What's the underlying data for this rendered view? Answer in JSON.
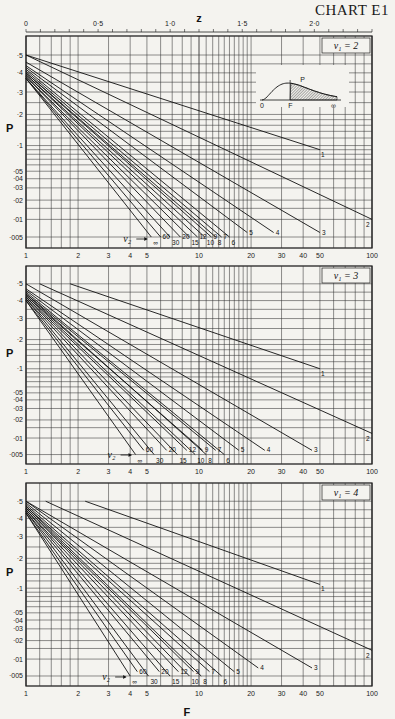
{
  "title": "CHART E1",
  "z_axis": {
    "label": "z",
    "ticks": [
      {
        "v": 0,
        "label": "0"
      },
      {
        "v": 0.5,
        "label": "0·5"
      },
      {
        "v": 1.0,
        "label": "1·0"
      },
      {
        "v": 1.5,
        "label": "1·5"
      },
      {
        "v": 2.0,
        "label": "2·0"
      }
    ]
  },
  "f_axis": {
    "label": "F",
    "ticks": [
      {
        "v": 1,
        "label": "1"
      },
      {
        "v": 2,
        "label": "2"
      },
      {
        "v": 3,
        "label": "3"
      },
      {
        "v": 4,
        "label": "4"
      },
      {
        "v": 5,
        "label": "5"
      },
      {
        "v": 10,
        "label": "10"
      },
      {
        "v": 20,
        "label": "20"
      },
      {
        "v": 30,
        "label": "30"
      },
      {
        "v": 40,
        "label": "40"
      },
      {
        "v": 50,
        "label": "50"
      },
      {
        "v": 100,
        "label": "100"
      }
    ]
  },
  "p_axis": {
    "label": "P",
    "ticks": [
      {
        "v": 0.5,
        "label": "·5"
      },
      {
        "v": 0.4,
        "label": "·4"
      },
      {
        "v": 0.3,
        "label": "·3"
      },
      {
        "v": 0.2,
        "label": "·2"
      },
      {
        "v": 0.1,
        "label": "·1"
      },
      {
        "v": 0.05,
        "label": "·05"
      },
      {
        "v": 0.04,
        "label": "·04"
      },
      {
        "v": 0.03,
        "label": "·03"
      },
      {
        "v": 0.02,
        "label": "·02"
      },
      {
        "v": 0.01,
        "label": "·01"
      },
      {
        "v": 0.005,
        "label": "·005"
      }
    ]
  },
  "inset": {
    "zero": "0",
    "f": "F",
    "inf": "∞",
    "p": "P"
  },
  "nu2_label": "ν₂",
  "chart_data": [
    {
      "type": "line",
      "title": "ν1 = 2",
      "panel_label": "ν₁ = 2",
      "xlabel": "F",
      "ylabel": "P",
      "xscale": "log",
      "xlim": [
        1,
        100
      ],
      "ylim": [
        0.005,
        0.5
      ],
      "series": [
        {
          "name": "1",
          "points": [
            [
              1,
              0.5
            ],
            [
              50,
              0.09
            ]
          ]
        },
        {
          "name": "2",
          "points": [
            [
              1,
              0.5
            ],
            [
              100,
              0.01
            ]
          ]
        },
        {
          "name": "3",
          "points": [
            [
              1,
              0.46
            ],
            [
              50,
              0.006
            ]
          ]
        },
        {
          "name": "4",
          "points": [
            [
              1,
              0.44
            ],
            [
              27,
              0.006
            ]
          ]
        },
        {
          "name": "5",
          "points": [
            [
              1,
              0.43
            ],
            [
              19,
              0.006
            ]
          ]
        },
        {
          "name": "6",
          "points": [
            [
              1,
              0.42
            ],
            [
              15,
              0.005
            ]
          ]
        },
        {
          "name": "7",
          "points": [
            [
              1,
              0.41
            ],
            [
              13.5,
              0.005
            ]
          ]
        },
        {
          "name": "8",
          "points": [
            [
              1,
              0.4
            ],
            [
              12.5,
              0.005
            ]
          ]
        },
        {
          "name": "9",
          "points": [
            [
              1,
              0.4
            ],
            [
              11.8,
              0.005
            ]
          ]
        },
        {
          "name": "10",
          "points": [
            [
              1,
              0.39
            ],
            [
              10.8,
              0.005
            ]
          ]
        },
        {
          "name": "12",
          "points": [
            [
              1,
              0.39
            ],
            [
              9.8,
              0.005
            ]
          ]
        },
        {
          "name": "15",
          "points": [
            [
              1,
              0.38
            ],
            [
              8.8,
              0.005
            ]
          ]
        },
        {
          "name": "20",
          "points": [
            [
              1,
              0.38
            ],
            [
              7.8,
              0.005
            ]
          ]
        },
        {
          "name": "30",
          "points": [
            [
              1,
              0.37
            ],
            [
              6.8,
              0.005
            ]
          ]
        },
        {
          "name": "60",
          "points": [
            [
              1,
              0.37
            ],
            [
              6.0,
              0.005
            ]
          ]
        },
        {
          "name": "∞",
          "points": [
            [
              1,
              0.37
            ],
            [
              5.3,
              0.005
            ]
          ]
        }
      ]
    },
    {
      "type": "line",
      "title": "ν1 = 3",
      "panel_label": "ν₁ = 3",
      "xlabel": "F",
      "ylabel": "P",
      "xscale": "log",
      "xlim": [
        1,
        100
      ],
      "ylim": [
        0.005,
        0.5
      ],
      "series": [
        {
          "name": "1",
          "points": [
            [
              1.8,
              0.5
            ],
            [
              50,
              0.1
            ]
          ]
        },
        {
          "name": "2",
          "points": [
            [
              1.2,
              0.5
            ],
            [
              100,
              0.012
            ]
          ]
        },
        {
          "name": "3",
          "points": [
            [
              1,
              0.5
            ],
            [
              45,
              0.006
            ]
          ]
        },
        {
          "name": "4",
          "points": [
            [
              1,
              0.47
            ],
            [
              24,
              0.006
            ]
          ]
        },
        {
          "name": "5",
          "points": [
            [
              1,
              0.46
            ],
            [
              17,
              0.006
            ]
          ]
        },
        {
          "name": "6",
          "points": [
            [
              1,
              0.45
            ],
            [
              14,
              0.005
            ]
          ]
        },
        {
          "name": "7",
          "points": [
            [
              1,
              0.44
            ],
            [
              12.5,
              0.006
            ]
          ]
        },
        {
          "name": "8",
          "points": [
            [
              1,
              0.44
            ],
            [
              11,
              0.005
            ]
          ]
        },
        {
          "name": "9",
          "points": [
            [
              1,
              0.43
            ],
            [
              10.5,
              0.006
            ]
          ]
        },
        {
          "name": "10",
          "points": [
            [
              1,
              0.43
            ],
            [
              9.5,
              0.005
            ]
          ]
        },
        {
          "name": "12",
          "points": [
            [
              1,
              0.42
            ],
            [
              8.5,
              0.006
            ]
          ]
        },
        {
          "name": "15",
          "points": [
            [
              1,
              0.42
            ],
            [
              7.5,
              0.005
            ]
          ]
        },
        {
          "name": "20",
          "points": [
            [
              1,
              0.41
            ],
            [
              6.5,
              0.006
            ]
          ]
        },
        {
          "name": "30",
          "points": [
            [
              1,
              0.41
            ],
            [
              5.5,
              0.005
            ]
          ]
        },
        {
          "name": "60",
          "points": [
            [
              1,
              0.4
            ],
            [
              4.8,
              0.006
            ]
          ]
        },
        {
          "name": "∞",
          "points": [
            [
              1,
              0.4
            ],
            [
              4.3,
              0.005
            ]
          ]
        }
      ]
    },
    {
      "type": "line",
      "title": "ν1 = 4",
      "panel_label": "ν₁ = 4",
      "xlabel": "F",
      "ylabel": "P",
      "xscale": "log",
      "xlim": [
        1,
        100
      ],
      "ylim": [
        0.005,
        0.5
      ],
      "series": [
        {
          "name": "1",
          "points": [
            [
              2.2,
              0.5
            ],
            [
              50,
              0.11
            ]
          ]
        },
        {
          "name": "2",
          "points": [
            [
              1.3,
              0.5
            ],
            [
              100,
              0.014
            ]
          ]
        },
        {
          "name": "3",
          "points": [
            [
              1,
              0.5
            ],
            [
              45,
              0.007
            ]
          ]
        },
        {
          "name": "4",
          "points": [
            [
              1,
              0.5
            ],
            [
              22,
              0.007
            ]
          ]
        },
        {
          "name": "5",
          "points": [
            [
              1,
              0.49
            ],
            [
              16,
              0.006
            ]
          ]
        },
        {
          "name": "6",
          "points": [
            [
              1,
              0.48
            ],
            [
              13.5,
              0.005
            ]
          ]
        },
        {
          "name": "7",
          "points": [
            [
              1,
              0.47
            ],
            [
              11.5,
              0.006
            ]
          ]
        },
        {
          "name": "8",
          "points": [
            [
              1,
              0.47
            ],
            [
              10.3,
              0.005
            ]
          ]
        },
        {
          "name": "9",
          "points": [
            [
              1,
              0.46
            ],
            [
              9.3,
              0.006
            ]
          ]
        },
        {
          "name": "10",
          "points": [
            [
              1,
              0.46
            ],
            [
              8.8,
              0.005
            ]
          ]
        },
        {
          "name": "12",
          "points": [
            [
              1,
              0.45
            ],
            [
              7.6,
              0.006
            ]
          ]
        },
        {
          "name": "15",
          "points": [
            [
              1,
              0.45
            ],
            [
              6.8,
              0.005
            ]
          ]
        },
        {
          "name": "20",
          "points": [
            [
              1,
              0.44
            ],
            [
              5.9,
              0.006
            ]
          ]
        },
        {
          "name": "30",
          "points": [
            [
              1,
              0.44
            ],
            [
              5.1,
              0.005
            ]
          ]
        },
        {
          "name": "60",
          "points": [
            [
              1,
              0.43
            ],
            [
              4.4,
              0.006
            ]
          ]
        },
        {
          "name": "∞",
          "points": [
            [
              1,
              0.43
            ],
            [
              4.0,
              0.005
            ]
          ]
        }
      ]
    }
  ]
}
